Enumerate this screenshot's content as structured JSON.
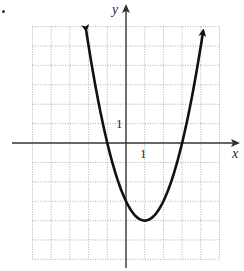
{
  "chart_data": {
    "type": "line",
    "title": "",
    "function": "y = x^2 - 2x - 3 = (x - 1)^2 - 4",
    "xlabel": "x",
    "ylabel": "y",
    "xlim": [
      -5,
      5
    ],
    "ylim": [
      -6,
      6
    ],
    "grid": true,
    "grid_style": "dotted",
    "tick_labels": {
      "x": [
        "1"
      ],
      "y": [
        "1"
      ]
    },
    "series": [
      {
        "name": "parabola",
        "x": [
          -2.13,
          -2,
          -1,
          0,
          1,
          2,
          3,
          4,
          4.13
        ],
        "y": [
          5.8,
          5,
          0,
          -3,
          -4,
          -3,
          0,
          5,
          5.8
        ],
        "arrows_at_ends": true
      }
    ],
    "key_points": {
      "vertex": [
        1,
        -4
      ],
      "x_intercepts": [
        -1,
        3
      ],
      "y_intercept": -3
    },
    "colors": {
      "curve": "#111111",
      "axes": "#333333",
      "grid": "#9a9a9a"
    }
  },
  "labels": {
    "x_axis": "x",
    "y_axis": "y",
    "x_tick_1": "1",
    "y_tick_1": "1"
  }
}
